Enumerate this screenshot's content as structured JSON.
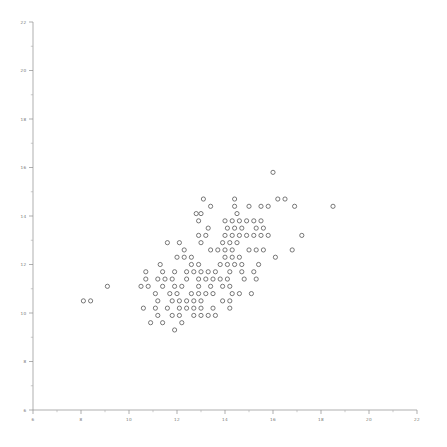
{
  "chart_data": {
    "type": "scatter",
    "title": "",
    "subtitle": "",
    "xlabel": "",
    "ylabel": "",
    "xlim": [
      6,
      22
    ],
    "ylim": [
      6,
      22
    ],
    "xticks": [
      6,
      8,
      10,
      12,
      14,
      16,
      18,
      20,
      22
    ],
    "yticks": [
      6,
      8,
      10,
      12,
      14,
      16,
      18,
      20,
      22
    ],
    "xtick_labels": [
      "6",
      "8",
      "10",
      "12",
      "14",
      "16",
      "18",
      "20",
      "22"
    ],
    "ytick_labels": [
      "6",
      "8",
      "10",
      "12",
      "14",
      "16",
      "18",
      "20",
      "22"
    ],
    "minor_tick_interval": 1,
    "grid": false,
    "legend": null,
    "legend_position": "none",
    "marker": {
      "style": "open-circle",
      "radius_px": 2.1,
      "stroke": "#4d4d4d",
      "fill": "none",
      "stroke_width": 0.75
    },
    "axis_color": "#8c8c8c",
    "background": "#ffffff",
    "annotations": [],
    "points": [
      [
        16.0,
        15.8
      ],
      [
        13.1,
        14.7
      ],
      [
        14.4,
        14.7
      ],
      [
        16.2,
        14.7
      ],
      [
        16.5,
        14.7
      ],
      [
        13.4,
        14.4
      ],
      [
        14.4,
        14.4
      ],
      [
        15.0,
        14.4
      ],
      [
        15.5,
        14.4
      ],
      [
        15.8,
        14.4
      ],
      [
        16.9,
        14.4
      ],
      [
        18.5,
        14.4
      ],
      [
        12.8,
        14.1
      ],
      [
        13.0,
        14.1
      ],
      [
        14.5,
        14.1
      ],
      [
        12.9,
        13.8
      ],
      [
        14.0,
        13.8
      ],
      [
        14.3,
        13.8
      ],
      [
        14.6,
        13.8
      ],
      [
        14.9,
        13.8
      ],
      [
        15.2,
        13.8
      ],
      [
        15.5,
        13.8
      ],
      [
        13.3,
        13.5
      ],
      [
        14.1,
        13.5
      ],
      [
        14.4,
        13.5
      ],
      [
        14.7,
        13.5
      ],
      [
        15.3,
        13.5
      ],
      [
        15.6,
        13.5
      ],
      [
        12.9,
        13.2
      ],
      [
        13.2,
        13.2
      ],
      [
        14.0,
        13.2
      ],
      [
        14.3,
        13.2
      ],
      [
        14.6,
        13.2
      ],
      [
        14.9,
        13.2
      ],
      [
        15.2,
        13.2
      ],
      [
        15.5,
        13.2
      ],
      [
        15.8,
        13.2
      ],
      [
        17.2,
        13.2
      ],
      [
        11.6,
        12.9
      ],
      [
        12.1,
        12.9
      ],
      [
        13.0,
        12.9
      ],
      [
        13.9,
        12.9
      ],
      [
        14.2,
        12.9
      ],
      [
        14.5,
        12.9
      ],
      [
        12.3,
        12.6
      ],
      [
        13.4,
        12.6
      ],
      [
        13.7,
        12.6
      ],
      [
        14.0,
        12.6
      ],
      [
        14.3,
        12.6
      ],
      [
        15.0,
        12.6
      ],
      [
        15.3,
        12.6
      ],
      [
        15.6,
        12.6
      ],
      [
        16.8,
        12.6
      ],
      [
        12.0,
        12.3
      ],
      [
        12.3,
        12.3
      ],
      [
        12.6,
        12.3
      ],
      [
        14.0,
        12.3
      ],
      [
        14.3,
        12.3
      ],
      [
        14.6,
        12.3
      ],
      [
        16.1,
        12.3
      ],
      [
        11.3,
        12.0
      ],
      [
        12.6,
        12.0
      ],
      [
        12.9,
        12.0
      ],
      [
        13.8,
        12.0
      ],
      [
        14.1,
        12.0
      ],
      [
        14.4,
        12.0
      ],
      [
        14.7,
        12.0
      ],
      [
        15.4,
        12.0
      ],
      [
        10.7,
        11.7
      ],
      [
        11.4,
        11.7
      ],
      [
        11.9,
        11.7
      ],
      [
        12.4,
        11.7
      ],
      [
        12.7,
        11.7
      ],
      [
        13.0,
        11.7
      ],
      [
        13.3,
        11.7
      ],
      [
        13.6,
        11.7
      ],
      [
        14.2,
        11.7
      ],
      [
        14.7,
        11.7
      ],
      [
        15.2,
        11.7
      ],
      [
        10.7,
        11.4
      ],
      [
        11.2,
        11.4
      ],
      [
        11.5,
        11.4
      ],
      [
        11.8,
        11.4
      ],
      [
        12.4,
        11.4
      ],
      [
        12.9,
        11.4
      ],
      [
        13.2,
        11.4
      ],
      [
        13.5,
        11.4
      ],
      [
        13.8,
        11.4
      ],
      [
        14.1,
        11.4
      ],
      [
        14.8,
        11.4
      ],
      [
        15.3,
        11.4
      ],
      [
        9.1,
        11.1
      ],
      [
        10.5,
        11.1
      ],
      [
        10.8,
        11.1
      ],
      [
        11.4,
        11.1
      ],
      [
        11.9,
        11.1
      ],
      [
        12.2,
        11.1
      ],
      [
        12.9,
        11.1
      ],
      [
        13.4,
        11.1
      ],
      [
        13.9,
        11.1
      ],
      [
        14.2,
        11.1
      ],
      [
        11.1,
        10.8
      ],
      [
        11.7,
        10.8
      ],
      [
        12.0,
        10.8
      ],
      [
        12.6,
        10.8
      ],
      [
        12.9,
        10.8
      ],
      [
        13.2,
        10.8
      ],
      [
        13.5,
        10.8
      ],
      [
        14.3,
        10.8
      ],
      [
        14.6,
        10.8
      ],
      [
        15.1,
        10.8
      ],
      [
        8.1,
        10.5
      ],
      [
        8.4,
        10.5
      ],
      [
        11.2,
        10.5
      ],
      [
        11.8,
        10.5
      ],
      [
        12.1,
        10.5
      ],
      [
        12.4,
        10.5
      ],
      [
        12.7,
        10.5
      ],
      [
        13.0,
        10.5
      ],
      [
        13.9,
        10.5
      ],
      [
        14.2,
        10.5
      ],
      [
        10.6,
        10.2
      ],
      [
        11.1,
        10.2
      ],
      [
        11.6,
        10.2
      ],
      [
        12.1,
        10.2
      ],
      [
        12.4,
        10.2
      ],
      [
        12.7,
        10.2
      ],
      [
        13.0,
        10.2
      ],
      [
        13.5,
        10.2
      ],
      [
        14.2,
        10.2
      ],
      [
        11.2,
        9.9
      ],
      [
        11.8,
        9.9
      ],
      [
        12.1,
        9.9
      ],
      [
        12.7,
        9.9
      ],
      [
        13.0,
        9.9
      ],
      [
        13.3,
        9.9
      ],
      [
        13.6,
        9.9
      ],
      [
        10.9,
        9.6
      ],
      [
        11.4,
        9.6
      ],
      [
        12.2,
        9.6
      ],
      [
        11.9,
        9.3
      ]
    ]
  }
}
